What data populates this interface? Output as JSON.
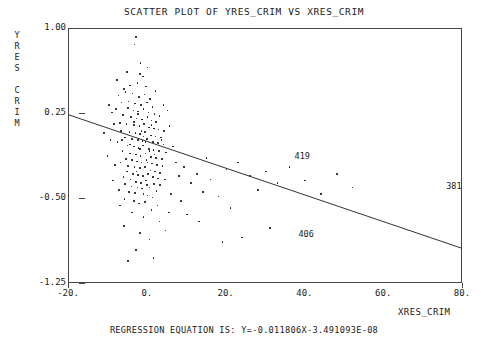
{
  "title": "SCATTER PLOT OF YRES_CRIM VS XRES_CRIM",
  "footer": "REGRESSION EQUATION IS: Y=-0.011806X-3.491093E-08",
  "axes": {
    "y_label_chars": [
      "Y",
      "R",
      "E",
      "S",
      "",
      "C",
      "R",
      "I",
      "M"
    ],
    "x_label": "XRES_CRIM"
  },
  "chart_data": {
    "type": "scatter",
    "title": "SCATTER PLOT OF YRES_CRIM VS XRES_CRIM",
    "xlabel": "XRES_CRIM",
    "ylabel": "YRES_CRIM",
    "xlim": [
      -20,
      80
    ],
    "ylim": [
      -1.25,
      1.0
    ],
    "xticks": [
      -20,
      0,
      20,
      40,
      60,
      80
    ],
    "xticklabels": [
      "-20.",
      "0.",
      "20.",
      "40.",
      "60.",
      "80."
    ],
    "yticks": [
      1.0,
      0.25,
      -0.5,
      -1.25
    ],
    "yticklabels": [
      "1.00",
      "0.25",
      "-0.50",
      "-1.25"
    ],
    "grid": false,
    "legend": null,
    "regression": {
      "equation": "Y=-0.011806X-3.491093E-08",
      "slope": -0.011806,
      "intercept": -3.491093e-08,
      "line_endpoints": [
        [
          -20,
          0.236
        ],
        [
          80,
          -0.944
        ]
      ]
    },
    "annotations": [
      {
        "label": "419",
        "x": 37.5,
        "y": -0.14
      },
      {
        "label": "381",
        "x": 76.0,
        "y": -0.4
      },
      {
        "label": "406",
        "x": 38.5,
        "y": -0.83
      }
    ],
    "points": [
      [
        -3.0,
        0.93
      ],
      [
        -3.3,
        0.86
      ],
      [
        -5.2,
        0.62
      ],
      [
        -2.0,
        0.6
      ],
      [
        -1.2,
        0.58
      ],
      [
        -6.0,
        0.47
      ],
      [
        -4.4,
        0.5
      ],
      [
        -2.6,
        0.52
      ],
      [
        -0.4,
        0.49
      ],
      [
        -7.4,
        0.41
      ],
      [
        -5.6,
        0.44
      ],
      [
        -3.8,
        0.43
      ],
      [
        -2.2,
        0.4
      ],
      [
        -0.8,
        0.42
      ],
      [
        0.6,
        0.38
      ],
      [
        -6.6,
        0.35
      ],
      [
        -4.8,
        0.36
      ],
      [
        -3.2,
        0.34
      ],
      [
        -1.6,
        0.33
      ],
      [
        -0.2,
        0.35
      ],
      [
        1.2,
        0.31
      ],
      [
        -8.0,
        0.29
      ],
      [
        -5.0,
        0.3
      ],
      [
        -3.6,
        0.28
      ],
      [
        -2.4,
        0.27
      ],
      [
        -1.0,
        0.29
      ],
      [
        0.2,
        0.26
      ],
      [
        1.8,
        0.25
      ],
      [
        3.0,
        0.23
      ],
      [
        -6.2,
        0.24
      ],
      [
        -4.2,
        0.22
      ],
      [
        -2.8,
        0.21
      ],
      [
        -1.4,
        0.2
      ],
      [
        0.0,
        0.22
      ],
      [
        1.0,
        0.19
      ],
      [
        2.2,
        0.18
      ],
      [
        -7.0,
        0.17
      ],
      [
        -5.4,
        0.16
      ],
      [
        -3.4,
        0.15
      ],
      [
        -2.1,
        0.14
      ],
      [
        -0.9,
        0.16
      ],
      [
        0.4,
        0.13
      ],
      [
        1.6,
        0.12
      ],
      [
        2.8,
        0.11
      ],
      [
        4.2,
        0.1
      ],
      [
        -6.8,
        0.1
      ],
      [
        -4.6,
        0.09
      ],
      [
        -3.1,
        0.08
      ],
      [
        -1.9,
        0.07
      ],
      [
        -0.6,
        0.09
      ],
      [
        0.8,
        0.06
      ],
      [
        2.0,
        0.05
      ],
      [
        3.4,
        0.04
      ],
      [
        -5.8,
        0.04
      ],
      [
        -4.0,
        0.03
      ],
      [
        -2.5,
        0.02
      ],
      [
        -1.3,
        0.01
      ],
      [
        -0.1,
        0.03
      ],
      [
        1.4,
        0.0
      ],
      [
        2.6,
        -0.01
      ],
      [
        4.0,
        -0.02
      ],
      [
        -7.6,
        0.0
      ],
      [
        -5.1,
        -0.03
      ],
      [
        -3.5,
        -0.04
      ],
      [
        -2.3,
        -0.05
      ],
      [
        -1.1,
        -0.03
      ],
      [
        0.3,
        -0.06
      ],
      [
        1.5,
        -0.07
      ],
      [
        2.9,
        -0.08
      ],
      [
        4.6,
        -0.09
      ],
      [
        -6.4,
        -0.08
      ],
      [
        -4.5,
        -0.1
      ],
      [
        -3.0,
        -0.11
      ],
      [
        -1.8,
        -0.12
      ],
      [
        -0.5,
        -0.1
      ],
      [
        0.9,
        -0.13
      ],
      [
        2.1,
        -0.14
      ],
      [
        3.6,
        -0.15
      ],
      [
        -5.5,
        -0.15
      ],
      [
        -3.9,
        -0.16
      ],
      [
        -2.7,
        -0.17
      ],
      [
        -1.5,
        -0.18
      ],
      [
        -0.3,
        -0.16
      ],
      [
        1.1,
        -0.19
      ],
      [
        2.4,
        -0.2
      ],
      [
        3.8,
        -0.21
      ],
      [
        -6.9,
        -0.18
      ],
      [
        -4.9,
        -0.21
      ],
      [
        -3.3,
        -0.22
      ],
      [
        -2.0,
        -0.23
      ],
      [
        -0.7,
        -0.22
      ],
      [
        0.7,
        -0.25
      ],
      [
        1.9,
        -0.26
      ],
      [
        3.2,
        -0.27
      ],
      [
        -5.3,
        -0.26
      ],
      [
        -3.7,
        -0.28
      ],
      [
        -2.4,
        -0.29
      ],
      [
        -1.2,
        -0.3
      ],
      [
        0.1,
        -0.28
      ],
      [
        1.3,
        -0.31
      ],
      [
        2.7,
        -0.32
      ],
      [
        4.4,
        -0.33
      ],
      [
        -6.1,
        -0.31
      ],
      [
        -4.3,
        -0.33
      ],
      [
        -2.9,
        -0.35
      ],
      [
        -1.7,
        -0.36
      ],
      [
        -0.4,
        -0.34
      ],
      [
        1.7,
        -0.37
      ],
      [
        3.1,
        -0.38
      ],
      [
        -5.7,
        -0.37
      ],
      [
        -4.1,
        -0.39
      ],
      [
        -2.6,
        -0.4
      ],
      [
        -1.4,
        -0.41
      ],
      [
        0.5,
        -0.4
      ],
      [
        2.3,
        -0.43
      ],
      [
        -7.2,
        -0.42
      ],
      [
        -4.7,
        -0.44
      ],
      [
        -3.2,
        -0.45
      ],
      [
        -1.0,
        -0.46
      ],
      [
        0.0,
        -0.47
      ],
      [
        1.2,
        -0.49
      ],
      [
        -5.9,
        -0.5
      ],
      [
        -3.4,
        -0.52
      ],
      [
        -2.2,
        -0.54
      ],
      [
        -0.6,
        -0.53
      ],
      [
        2.5,
        -0.56
      ],
      [
        -8.6,
        0.16
      ],
      [
        -9.4,
        0.02
      ],
      [
        -10.2,
        -0.12
      ],
      [
        -9.0,
        0.26
      ],
      [
        -8.2,
        -0.2
      ],
      [
        5.6,
        0.14
      ],
      [
        6.4,
        -0.04
      ],
      [
        7.2,
        -0.18
      ],
      [
        5.0,
        0.28
      ],
      [
        8.0,
        -0.3
      ],
      [
        9.2,
        -0.22
      ],
      [
        6.0,
        -0.46
      ],
      [
        -7.8,
        0.55
      ],
      [
        -1.8,
        0.7
      ],
      [
        0.0,
        0.66
      ],
      [
        2.0,
        0.45
      ],
      [
        4.0,
        0.33
      ],
      [
        -9.8,
        0.33
      ],
      [
        -11.0,
        0.08
      ],
      [
        -8.8,
        -0.34
      ],
      [
        -7.0,
        -0.56
      ],
      [
        -4.0,
        -0.62
      ],
      [
        -1.0,
        -0.66
      ],
      [
        1.0,
        -0.6
      ],
      [
        3.0,
        -0.7
      ],
      [
        5.5,
        -0.62
      ],
      [
        -6.0,
        -0.74
      ],
      [
        -2.0,
        -0.8
      ],
      [
        0.5,
        -0.86
      ],
      [
        4.5,
        -0.78
      ],
      [
        -3.0,
        -0.95
      ],
      [
        1.5,
        -1.02
      ],
      [
        -5.0,
        -1.05
      ],
      [
        8.5,
        -0.52
      ],
      [
        11.0,
        -0.36
      ],
      [
        12.5,
        -0.28
      ],
      [
        14.0,
        -0.44
      ],
      [
        10.0,
        -0.64
      ],
      [
        13.0,
        -0.7
      ],
      [
        16.0,
        -0.33
      ],
      [
        18.0,
        -0.48
      ],
      [
        15.0,
        -0.14
      ],
      [
        20.0,
        -0.24
      ],
      [
        23.0,
        -0.18
      ],
      [
        26.0,
        -0.3
      ],
      [
        21.0,
        -0.58
      ],
      [
        28.0,
        -0.42
      ],
      [
        30.0,
        -0.26
      ],
      [
        33.0,
        -0.36
      ],
      [
        36.0,
        -0.22
      ],
      [
        40.0,
        -0.34
      ],
      [
        44.0,
        -0.46
      ],
      [
        48.0,
        -0.28
      ],
      [
        52.0,
        -0.4
      ],
      [
        24.0,
        -0.84
      ],
      [
        31.0,
        -0.76
      ],
      [
        19.0,
        -0.88
      ],
      [
        -2.5,
        0.25
      ],
      [
        -1.5,
        0.1
      ],
      [
        -0.5,
        0.0
      ],
      [
        0.5,
        -0.08
      ],
      [
        1.0,
        0.15
      ],
      [
        -1.0,
        0.05
      ],
      [
        -2.0,
        -0.06
      ],
      [
        0.0,
        -0.18
      ],
      [
        -3.5,
        0.18
      ],
      [
        -4.5,
        -0.02
      ],
      [
        -2.8,
        -0.26
      ],
      [
        -0.2,
        -0.38
      ],
      [
        1.8,
        -0.11
      ],
      [
        3.5,
        0.02
      ],
      [
        -6.5,
        0.02
      ]
    ]
  }
}
